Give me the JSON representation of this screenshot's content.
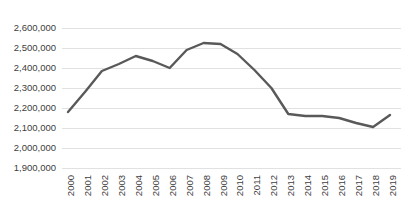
{
  "chart_data": {
    "type": "line",
    "title": "",
    "subtitle": "",
    "xlabel": "",
    "ylabel": "",
    "grid": true,
    "legend": false,
    "legend_position": "none",
    "line_color": "#595959",
    "gridline_color": "#d9d9d9",
    "background_color": "#ffffff",
    "axis_label_color": "#404040",
    "xlim": [
      2000,
      2019
    ],
    "ylim": [
      1900000,
      2600000
    ],
    "ytick_step": 100000,
    "x": [
      2000,
      2001,
      2002,
      2003,
      2004,
      2005,
      2006,
      2007,
      2008,
      2009,
      2010,
      2011,
      2012,
      2013,
      2014,
      2015,
      2016,
      2017,
      2018,
      2019
    ],
    "categories": [
      "2000",
      "2001",
      "2002",
      "2003",
      "2004",
      "2005",
      "2006",
      "2007",
      "2008",
      "2009",
      "2010",
      "2011",
      "2012",
      "2013",
      "2014",
      "2015",
      "2016",
      "2017",
      "2018",
      "2019"
    ],
    "values": [
      2180000,
      2280000,
      2385000,
      2420000,
      2460000,
      2435000,
      2400000,
      2490000,
      2525000,
      2520000,
      2470000,
      2390000,
      2300000,
      2170000,
      2160000,
      2160000,
      2150000,
      2125000,
      2105000,
      2165000
    ],
    "series": [
      {
        "name": "Series 1",
        "values": [
          2180000,
          2280000,
          2385000,
          2420000,
          2460000,
          2435000,
          2400000,
          2490000,
          2525000,
          2520000,
          2470000,
          2390000,
          2300000,
          2170000,
          2160000,
          2160000,
          2150000,
          2125000,
          2105000,
          2165000
        ]
      }
    ],
    "ytick_labels": [
      "1,900,000",
      "2,000,000",
      "2,100,000",
      "2,200,000",
      "2,300,000",
      "2,400,000",
      "2,500,000",
      "2,600,000"
    ],
    "ytick_values": [
      1900000,
      2000000,
      2100000,
      2200000,
      2300000,
      2400000,
      2500000,
      2600000
    ],
    "xtick_labels": [
      "2000",
      "2001",
      "2002",
      "2003",
      "2004",
      "2005",
      "2006",
      "2007",
      "2008",
      "2009",
      "2010",
      "2011",
      "2012",
      "2013",
      "2014",
      "2015",
      "2016",
      "2017",
      "2018",
      "2019"
    ]
  }
}
